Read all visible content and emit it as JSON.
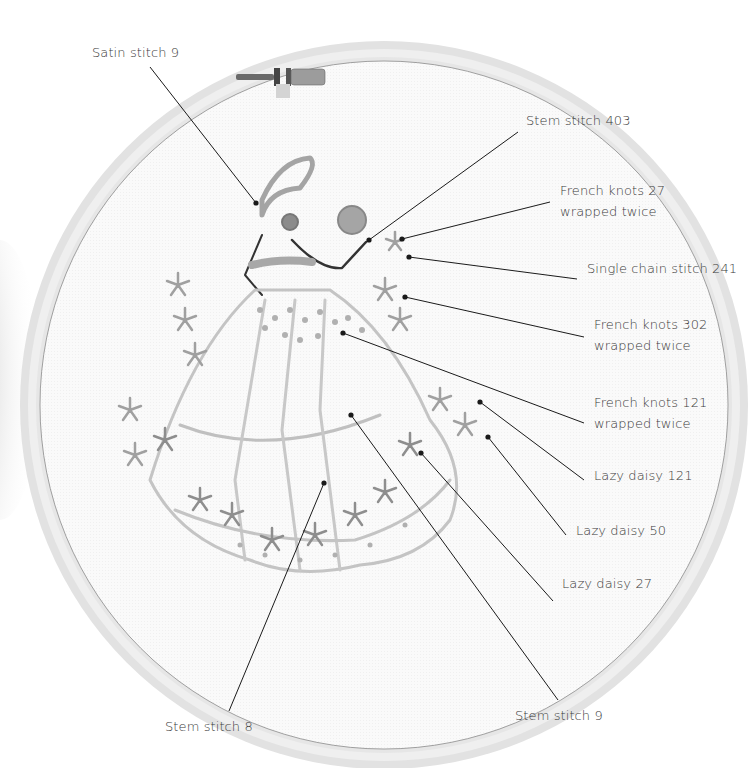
{
  "diagram": {
    "colors": {
      "background": "#ffffff",
      "hoop_outer": "#d9d9d9",
      "hoop_inner": "#ececec",
      "fabric": "#fbfbfb",
      "leader_line": "#1a1a1a",
      "stitch_light": "#b9b9b9",
      "stitch_mid": "#8f8f8f",
      "stitch_dark": "#555555",
      "label_text": "#3a3a3a"
    },
    "labels": [
      {
        "id": "satin-stitch-9",
        "lines": [
          "Satin stitch 9"
        ],
        "x": 92,
        "y": 42,
        "anchor": [
          256,
          203
        ],
        "line_start": [
          150,
          67
        ]
      },
      {
        "id": "stem-stitch-403",
        "lines": [
          "Stem stitch 403"
        ],
        "x": 526,
        "y": 110,
        "anchor": [
          369,
          240
        ],
        "line_start": [
          518,
          132
        ]
      },
      {
        "id": "french-knots-27",
        "lines": [
          "French knots 27",
          "wrapped twice"
        ],
        "x": 560,
        "y": 180,
        "anchor": [
          402,
          239
        ],
        "line_start": [
          550,
          202
        ]
      },
      {
        "id": "single-chain-stitch-241",
        "lines": [
          "Single chain stitch 241"
        ],
        "x": 587,
        "y": 258,
        "anchor": [
          409,
          257
        ],
        "line_start": [
          577,
          279
        ]
      },
      {
        "id": "french-knots-302",
        "lines": [
          "French knots 302",
          "wrapped twice"
        ],
        "x": 594,
        "y": 314,
        "anchor": [
          405,
          297
        ],
        "line_start": [
          584,
          337
        ]
      },
      {
        "id": "french-knots-121",
        "lines": [
          "French knots 121",
          "wrapped twice"
        ],
        "x": 594,
        "y": 392,
        "anchor": [
          343,
          333
        ],
        "line_start": [
          584,
          423
        ]
      },
      {
        "id": "lazy-daisy-121",
        "lines": [
          "Lazy daisy 121"
        ],
        "x": 594,
        "y": 465,
        "anchor": [
          480,
          402
        ],
        "line_start": [
          584,
          480
        ]
      },
      {
        "id": "lazy-daisy-50",
        "lines": [
          "Lazy daisy 50"
        ],
        "x": 576,
        "y": 520,
        "anchor": [
          488,
          437
        ],
        "line_start": [
          566,
          535
        ]
      },
      {
        "id": "lazy-daisy-27",
        "lines": [
          "Lazy daisy 27"
        ],
        "x": 562,
        "y": 573,
        "anchor": [
          421,
          453
        ],
        "line_start": [
          553,
          601
        ]
      },
      {
        "id": "stem-stitch-8",
        "lines": [
          "Stem stitch 8"
        ],
        "x": 165,
        "y": 716,
        "anchor": [
          324,
          483
        ],
        "line_start": [
          229,
          711
        ]
      },
      {
        "id": "stem-stitch-9",
        "lines": [
          "Stem stitch 9"
        ],
        "x": 515,
        "y": 705,
        "anchor": [
          351,
          415
        ],
        "line_start": [
          558,
          700
        ]
      }
    ]
  }
}
